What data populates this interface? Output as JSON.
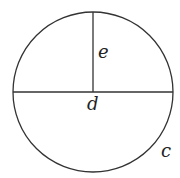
{
  "diagram": {
    "type": "circle-geometry",
    "circle": {
      "cx": 93,
      "cy": 92,
      "r": 80
    },
    "stroke_color": "#333333",
    "labels": {
      "radius": "e",
      "diameter": "d",
      "circumference": "c"
    }
  }
}
